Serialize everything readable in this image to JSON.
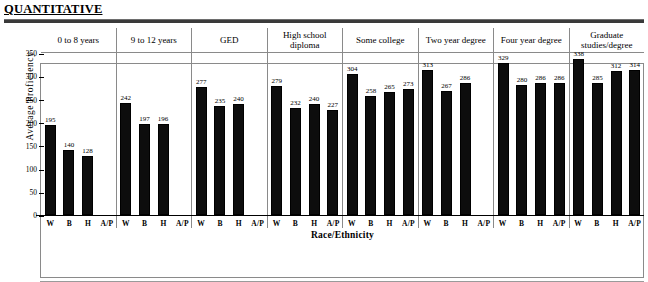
{
  "header": {
    "title": "QUANTITATIVE"
  },
  "axis": {
    "y_label": "Average Proficiency",
    "x_label": "Race/Ethnicity",
    "y_ticks": [
      "350",
      "300",
      "250",
      "200",
      "150",
      "100",
      "50",
      "0"
    ]
  },
  "categories_short": [
    "W",
    "B",
    "H",
    "A/P"
  ],
  "chart_data": {
    "type": "bar",
    "title": "QUANTITATIVE",
    "xlabel": "Race/Ethnicity",
    "ylabel": "Average Proficiency",
    "ylim": [
      0,
      350
    ],
    "ytick_step": 50,
    "grid": false,
    "legend_position": "none",
    "panel_variable": "Education level",
    "categories": [
      "W",
      "B",
      "H",
      "A/P"
    ],
    "category_names": [
      "White",
      "Black",
      "Hispanic",
      "Asian/Pacific Islander"
    ],
    "panels": [
      {
        "label": "0 to 8 years",
        "values": [
          195,
          140,
          128,
          null
        ],
        "value_labels": [
          "195",
          "140",
          "128",
          ""
        ]
      },
      {
        "label": "9 to 12 years",
        "values": [
          242,
          197,
          196,
          null
        ],
        "value_labels": [
          "242",
          "197",
          "196",
          ""
        ]
      },
      {
        "label": "GED",
        "values": [
          277,
          235,
          240,
          null
        ],
        "value_labels": [
          "277",
          "235",
          "240",
          ""
        ]
      },
      {
        "label": "High school diploma",
        "values": [
          279,
          232,
          240,
          227
        ],
        "value_labels": [
          "279",
          "232",
          "240",
          "227"
        ]
      },
      {
        "label": "Some college",
        "values": [
          304,
          258,
          265,
          273
        ],
        "value_labels": [
          "304",
          "258",
          "265",
          "273"
        ]
      },
      {
        "label": "Two year degree",
        "values": [
          313,
          267,
          286,
          null
        ],
        "value_labels": [
          "313",
          "267",
          "286",
          ""
        ]
      },
      {
        "label": "Four year degree",
        "values": [
          329,
          280,
          286,
          286
        ],
        "value_labels": [
          "329",
          "280",
          "286",
          "286"
        ]
      },
      {
        "label": "Graduate studies/degree",
        "values": [
          338,
          285,
          312,
          314
        ],
        "value_labels": [
          "338",
          "285",
          "312",
          "314"
        ]
      }
    ]
  },
  "colors": {
    "bar": "#0d0d0d",
    "frame": "#8a8a8a",
    "rule": "#3a3a3a"
  }
}
